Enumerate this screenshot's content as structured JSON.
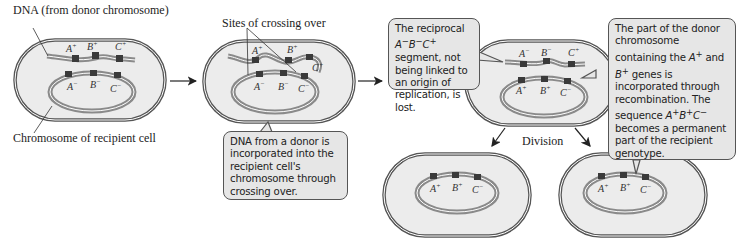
{
  "labels": {
    "donor_dna": "DNA (from donor chromosome)",
    "recipient_chromosome": "Chromosome of recipient cell",
    "crossing_sites": "Sites of crossing over",
    "division": "Division"
  },
  "genes": {
    "A_plus": "A⁺",
    "B_plus": "B⁺",
    "C_plus": "C⁺",
    "A_minus": "A⁻",
    "B_minus": "B⁻",
    "C_minus": "C⁻"
  },
  "callouts": {
    "crossing_over": "DNA from a donor is incorporated into the recipient cell's chromosome through crossing over.",
    "lost_segment_html": "The reciprocal <i>A</i><sup>−</sup><i>B</i><sup>−</sup><i>C</i><sup>+</sup> segment, not being linked to an origin of replication, is lost.",
    "incorporated_html": "The part of the donor chromosome containing the <i>A</i><sup>+</sup> and <i>B</i><sup>+</sup> genes is incorporated through recombination. The sequence <i>A</i><sup>+</sup><i>B</i><sup>+</sup><i>C</i><sup>−</sup> becomes a permanent part of the recipient genotype."
  },
  "colors": {
    "cell_fill": "#ececec",
    "cell_stroke": "#555555",
    "chromosome": "#8a8a8a",
    "gene_band": "#3a3a3a"
  }
}
